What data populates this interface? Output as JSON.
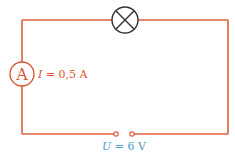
{
  "diagram": {
    "type": "electric-circuit",
    "components": {
      "lamp": {
        "symbol": "lamp-icon"
      },
      "ammeter": {
        "symbol_letter": "A",
        "reading_var": "I",
        "reading_value": "= 0,5 A"
      },
      "source": {
        "reading_var": "U",
        "reading_value": "= 6 V"
      }
    },
    "colors": {
      "wire": "#e0603a",
      "ammeter": "#d9542e",
      "lamp": "#333333",
      "voltage_label": "#4a9cc9",
      "current_label": "#d9542e"
    }
  }
}
